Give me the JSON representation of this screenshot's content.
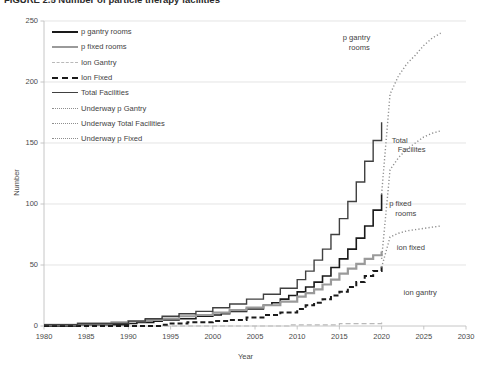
{
  "figure": {
    "caption_visible_fragment": "FIGURE 2.5   Number of particle therapy facilities",
    "caption_note": "top of caption clipped by screenshot edge"
  },
  "chart_data": {
    "type": "line",
    "title": "",
    "xlabel": "Year",
    "ylabel": "Number",
    "xlim": [
      1980,
      2030
    ],
    "ylim": [
      0,
      250
    ],
    "xticks": [
      1980,
      1985,
      1990,
      1995,
      2000,
      2005,
      2010,
      2015,
      2020,
      2025,
      2030
    ],
    "yticks": [
      0,
      50,
      100,
      150,
      200,
      250
    ],
    "grid": "horizontal",
    "legend_position": "upper-left-inside",
    "series": [
      {
        "name": "p gantry rooms",
        "style": "solid",
        "color": "#1a1a1a",
        "width": 1.6,
        "x": [
          1980,
          1984,
          1990,
          1991,
          1993,
          1994,
          1996,
          1998,
          2000,
          2001,
          2002,
          2004,
          2006,
          2007,
          2008,
          2009,
          2010,
          2011,
          2012,
          2013,
          2014,
          2015,
          2016,
          2017,
          2018,
          2019,
          2020
        ],
        "y": [
          0,
          1,
          2,
          3,
          4,
          5,
          6,
          8,
          9,
          10,
          12,
          14,
          17,
          19,
          22,
          25,
          28,
          32,
          36,
          41,
          48,
          55,
          63,
          72,
          82,
          95,
          108
        ]
      },
      {
        "name": "p fixed rooms",
        "style": "solid",
        "color": "#9a9a9a",
        "width": 2.2,
        "x": [
          1980,
          1984,
          1988,
          1990,
          1992,
          1994,
          1996,
          1998,
          2000,
          2002,
          2004,
          2006,
          2008,
          2010,
          2011,
          2012,
          2013,
          2014,
          2015,
          2016,
          2017,
          2018,
          2019,
          2020
        ],
        "y": [
          1,
          2,
          3,
          4,
          5,
          6,
          8,
          9,
          11,
          13,
          15,
          17,
          20,
          24,
          27,
          30,
          34,
          38,
          43,
          47,
          51,
          55,
          58,
          61
        ]
      },
      {
        "name": "Ion Gantry",
        "style": "dashed",
        "color": "#b9b9b9",
        "width": 1.2,
        "x": [
          1980,
          2000,
          2009,
          2012,
          2015,
          2018,
          2020
        ],
        "y": [
          0,
          0,
          1,
          1,
          2,
          2,
          3
        ]
      },
      {
        "name": "Ion Fixed",
        "style": "dashed",
        "color": "#1a1a1a",
        "width": 2.0,
        "x": [
          1980,
          1994,
          1995,
          1997,
          2000,
          2002,
          2004,
          2006,
          2008,
          2010,
          2011,
          2012,
          2013,
          2014,
          2015,
          2016,
          2017,
          2018,
          2019,
          2020
        ],
        "y": [
          0,
          1,
          2,
          3,
          4,
          5,
          7,
          9,
          11,
          14,
          17,
          19,
          22,
          25,
          28,
          32,
          36,
          41,
          45,
          50
        ]
      },
      {
        "name": "Total Facilities",
        "style": "solid",
        "color": "#404040",
        "width": 1.4,
        "x": [
          1980,
          1984,
          1990,
          1992,
          1994,
          1996,
          1998,
          2000,
          2002,
          2004,
          2006,
          2008,
          2010,
          2011,
          2012,
          2013,
          2014,
          2015,
          2016,
          2017,
          2018,
          2019,
          2020
        ],
        "y": [
          1,
          2,
          4,
          6,
          8,
          10,
          12,
          15,
          18,
          22,
          26,
          31,
          38,
          45,
          54,
          63,
          75,
          88,
          102,
          118,
          135,
          152,
          167
        ]
      },
      {
        "name": "Underway p Gantry",
        "style": "dotted",
        "color": "#8e8e8e",
        "width": 1.4,
        "x": [
          2020,
          2021,
          2022,
          2023,
          2024,
          2025,
          2026,
          2027
        ],
        "y": [
          108,
          190,
          205,
          215,
          222,
          230,
          236,
          240
        ]
      },
      {
        "name": "Underway Total Facilities",
        "style": "dotted",
        "color": "#8e8e8e",
        "width": 1.4,
        "x": [
          2020,
          2021,
          2022,
          2023,
          2024,
          2025,
          2026,
          2027
        ],
        "y": [
          55,
          128,
          138,
          145,
          150,
          155,
          158,
          160
        ]
      },
      {
        "name": "Underway p Fixed",
        "style": "dotted",
        "color": "#8e8e8e",
        "width": 1.4,
        "x": [
          2020,
          2021,
          2022,
          2023,
          2024,
          2025,
          2026,
          2027
        ],
        "y": [
          48,
          73,
          76,
          78,
          79,
          80,
          81,
          82
        ]
      }
    ],
    "annotations": [
      {
        "text": "p gantry rooms",
        "x": 2017,
        "y": 232
      },
      {
        "text": "Total Facilites",
        "x": 2021,
        "y": 148
      },
      {
        "text": "p fixed rooms",
        "x": 2021,
        "y": 96
      },
      {
        "text": "ion fixed",
        "x": 2022,
        "y": 64
      },
      {
        "text": "ion gantry",
        "x": 2023,
        "y": 25
      }
    ]
  },
  "legend": {
    "items": [
      {
        "label": "p gantry rooms",
        "key": "k-solid-blk"
      },
      {
        "label": "p fixed rooms",
        "key": "k-solid-gry"
      },
      {
        "label": "Ion Gantry",
        "key": "k-dash-lite"
      },
      {
        "label": "Ion Fixed",
        "key": "k-dash-blk"
      },
      {
        "label": "Total Facilities",
        "key": "k-solid-dark"
      },
      {
        "label": "Underway p Gantry",
        "key": "k-dot"
      },
      {
        "label": "Underway Total Facilities",
        "key": "k-dot"
      },
      {
        "label": "Underway p Fixed",
        "key": "k-dot"
      }
    ]
  },
  "axes": {
    "ylabel": "Number",
    "xlabel": "Year",
    "yticks": [
      "0",
      "50",
      "100",
      "150",
      "200",
      "250"
    ],
    "xticks": [
      "1980",
      "1985",
      "1990",
      "1995",
      "2000",
      "2005",
      "2010",
      "2015",
      "2020",
      "2025",
      "2030"
    ]
  },
  "annotations": {
    "p_gantry_rooms_l1": "p gantry",
    "p_gantry_rooms_l2": "rooms",
    "total_facilities_l1": "Total",
    "total_facilities_l2": "Facilites",
    "p_fixed_rooms_l1": "p fixed",
    "p_fixed_rooms_l2": "rooms",
    "ion_fixed": "ion fixed",
    "ion_gantry": "ion gantry"
  },
  "colors": {
    "p_gantry": "#1a1a1a",
    "p_fixed": "#9a9a9a",
    "ion_gantry": "#b9b9b9",
    "ion_fixed": "#1a1a1a",
    "total": "#404040",
    "underway": "#8e8e8e",
    "grid": "#d9d9d9",
    "axis": "#bfbfbf",
    "text": "#3f3f3f"
  }
}
